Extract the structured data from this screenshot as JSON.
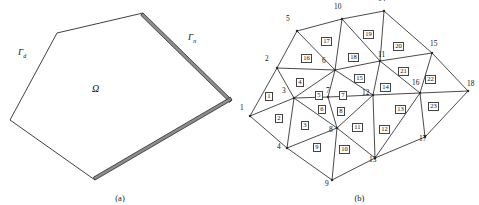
{
  "figure": {
    "panel_a": {
      "caption": "(a)",
      "domain_label": "Ω",
      "boundary_labels": [
        {
          "text": "Γ",
          "sub": "d",
          "x": 18,
          "y": 47,
          "name": "gamma-d-label"
        },
        {
          "text": "Γ",
          "sub": "n",
          "x": 188,
          "y": 32,
          "name": "gamma-n-label"
        }
      ],
      "domain_label_pos": {
        "x": 92,
        "y": 83
      },
      "polygon": [
        {
          "x": 143,
          "y": 13
        },
        {
          "x": 57,
          "y": 33
        },
        {
          "x": 10,
          "y": 120
        },
        {
          "x": 95,
          "y": 180
        },
        {
          "x": 232,
          "y": 100
        }
      ],
      "thin_edges": [
        [
          1,
          2
        ],
        [
          2,
          3
        ],
        [
          0,
          1
        ]
      ],
      "thick_edges": [
        [
          0,
          4
        ],
        [
          4,
          3
        ]
      ],
      "thick_band_width": 3.2
    },
    "panel_b": {
      "caption": "(b)",
      "nodes": [
        {
          "id": 1,
          "x": 10,
          "y": 116,
          "lx": -6,
          "ly": -4
        },
        {
          "id": 2,
          "x": 37,
          "y": 68,
          "lx": -8,
          "ly": -5
        },
        {
          "id": 3,
          "x": 54,
          "y": 98,
          "lx": -8,
          "ly": -3
        },
        {
          "id": 4,
          "x": 47,
          "y": 148,
          "lx": -6,
          "ly": 3
        },
        {
          "id": 5,
          "x": 57,
          "y": 31,
          "lx": -7,
          "ly": -8
        },
        {
          "id": 6,
          "x": 95,
          "y": 70,
          "lx": -9,
          "ly": -5
        },
        {
          "id": 7,
          "x": 88,
          "y": 97,
          "lx": 2,
          "ly": -2
        },
        {
          "id": 8,
          "x": 97,
          "y": 128,
          "lx": -4,
          "ly": 6
        },
        {
          "id": 9,
          "x": 92,
          "y": 180,
          "lx": -3,
          "ly": 8
        },
        {
          "id": 10,
          "x": 102,
          "y": 19,
          "lx": -4,
          "ly": -8
        },
        {
          "id": 11,
          "x": 140,
          "y": 61,
          "lx": 2,
          "ly": -2
        },
        {
          "id": 12,
          "x": 133,
          "y": 95,
          "lx": -7,
          "ly": 2
        },
        {
          "id": 13,
          "x": 135,
          "y": 158,
          "lx": -2,
          "ly": 6
        },
        {
          "id": 14,
          "x": 144,
          "y": 11,
          "lx": -2,
          "ly": -8
        },
        {
          "id": 15,
          "x": 192,
          "y": 53,
          "lx": 2,
          "ly": -5
        },
        {
          "id": 16,
          "x": 180,
          "y": 93,
          "lx": -4,
          "ly": -6
        },
        {
          "id": 17,
          "x": 185,
          "y": 137,
          "lx": -2,
          "ly": 6
        },
        {
          "id": 18,
          "x": 228,
          "y": 91,
          "lx": 3,
          "ly": -3
        }
      ],
      "edges": [
        [
          1,
          2
        ],
        [
          1,
          3
        ],
        [
          1,
          4
        ],
        [
          2,
          3
        ],
        [
          2,
          5
        ],
        [
          2,
          6
        ],
        [
          3,
          4
        ],
        [
          3,
          6
        ],
        [
          3,
          7
        ],
        [
          3,
          8
        ],
        [
          4,
          8
        ],
        [
          4,
          9
        ],
        [
          5,
          6
        ],
        [
          5,
          10
        ],
        [
          6,
          7
        ],
        [
          6,
          10
        ],
        [
          6,
          11
        ],
        [
          6,
          12
        ],
        [
          7,
          8
        ],
        [
          7,
          12
        ],
        [
          8,
          9
        ],
        [
          8,
          12
        ],
        [
          8,
          13
        ],
        [
          9,
          13
        ],
        [
          10,
          11
        ],
        [
          10,
          14
        ],
        [
          11,
          12
        ],
        [
          11,
          14
        ],
        [
          11,
          15
        ],
        [
          11,
          16
        ],
        [
          12,
          13
        ],
        [
          12,
          16
        ],
        [
          13,
          16
        ],
        [
          13,
          17
        ],
        [
          14,
          15
        ],
        [
          15,
          16
        ],
        [
          15,
          18
        ],
        [
          16,
          17
        ],
        [
          16,
          18
        ],
        [
          17,
          18
        ]
      ],
      "elements": [
        {
          "id": 1,
          "x": 30,
          "y": 97
        },
        {
          "id": 2,
          "x": 40,
          "y": 119
        },
        {
          "id": 3,
          "x": 66,
          "y": 126
        },
        {
          "id": 4,
          "x": 61,
          "y": 83
        },
        {
          "id": 5,
          "x": 80,
          "y": 96
        },
        {
          "id": 6,
          "x": 83,
          "y": 110
        },
        {
          "id": 7,
          "x": 104,
          "y": 96
        },
        {
          "id": 8,
          "x": 102,
          "y": 112
        },
        {
          "id": 9,
          "x": 78,
          "y": 148
        },
        {
          "id": 10,
          "x": 104,
          "y": 150
        },
        {
          "id": 11,
          "x": 117,
          "y": 128
        },
        {
          "id": 12,
          "x": 144,
          "y": 130
        },
        {
          "id": 13,
          "x": 160,
          "y": 110
        },
        {
          "id": 14,
          "x": 145,
          "y": 88
        },
        {
          "id": 15,
          "x": 119,
          "y": 79
        },
        {
          "id": 16,
          "x": 66,
          "y": 59
        },
        {
          "id": 17,
          "x": 86,
          "y": 42
        },
        {
          "id": 18,
          "x": 113,
          "y": 58
        },
        {
          "id": 19,
          "x": 128,
          "y": 35
        },
        {
          "id": 20,
          "x": 158,
          "y": 47
        },
        {
          "id": 21,
          "x": 163,
          "y": 72
        },
        {
          "id": 22,
          "x": 190,
          "y": 80
        },
        {
          "id": 23,
          "x": 193,
          "y": 107
        }
      ]
    }
  },
  "style": {
    "line_color": "#2b2b2b",
    "band_fill": "#8d8d8d",
    "text_color": "#111111",
    "background": "#ffffff"
  }
}
